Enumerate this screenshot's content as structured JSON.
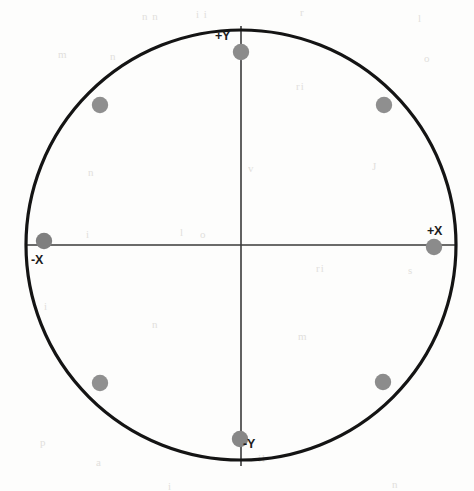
{
  "figure": {
    "background_color": "#fdfdfc",
    "circle": {
      "name": "boundary-circle",
      "center_x": 241,
      "center_y": 245,
      "radius": 215,
      "stroke_color": "#141414",
      "stroke_width": 3.2
    },
    "axes": [
      {
        "name": "horizontal-axis",
        "orientation": "horizontal",
        "x1": 26,
        "y1": 245,
        "x2": 456,
        "y2": 245,
        "stroke_color": "#3a3a3a",
        "stroke_width": 1.6
      },
      {
        "name": "vertical-axis",
        "orientation": "vertical",
        "x1": 241,
        "y1": 26,
        "x2": 241,
        "y2": 466,
        "stroke_color": "#3a3a3a",
        "stroke_width": 1.6
      }
    ],
    "labels": [
      {
        "id": "plus-y",
        "text": "+Y",
        "x": 215,
        "y": 29,
        "anchor": "top-vertical-left"
      },
      {
        "id": "plus-x",
        "text": "+X",
        "x": 427,
        "y": 224,
        "anchor": "right-horizontal-above"
      },
      {
        "id": "minus-x",
        "text": "-X",
        "x": 31,
        "y": 253,
        "anchor": "left-horizontal-below"
      },
      {
        "id": "minus-y",
        "text": "-Y",
        "x": 243,
        "y": 437,
        "anchor": "bottom-vertical-right"
      }
    ],
    "points": [
      {
        "id": "point-top",
        "label": "+Y marker",
        "cx": 241,
        "cy": 52,
        "r": 8.2,
        "color": "#8b8b8b"
      },
      {
        "id": "point-upper-left",
        "label": "upper-left",
        "cx": 100,
        "cy": 105,
        "r": 8.2,
        "color": "#8f8f8f"
      },
      {
        "id": "point-upper-right",
        "label": "upper-right",
        "cx": 384,
        "cy": 105,
        "r": 8.2,
        "color": "#8f8f8f"
      },
      {
        "id": "point-left",
        "label": "-X marker",
        "cx": 44,
        "cy": 241,
        "r": 8.2,
        "color": "#7f7f7f"
      },
      {
        "id": "point-right",
        "label": "+X marker",
        "cx": 434,
        "cy": 247,
        "r": 8.2,
        "color": "#8b8b8b"
      },
      {
        "id": "point-lower-left",
        "label": "lower-left",
        "cx": 100,
        "cy": 383,
        "r": 8.2,
        "color": "#909090"
      },
      {
        "id": "point-lower-right",
        "label": "lower-right",
        "cx": 383,
        "cy": 382,
        "r": 8.2,
        "color": "#8c8c8c"
      },
      {
        "id": "point-bottom",
        "label": "-Y marker",
        "cx": 240,
        "cy": 439,
        "r": 8.2,
        "color": "#878787"
      }
    ],
    "scan_artifacts": [
      {
        "text": "n n",
        "x": 142,
        "y": 10
      },
      {
        "text": "i i",
        "x": 196,
        "y": 8
      },
      {
        "text": "r",
        "x": 300,
        "y": 6
      },
      {
        "text": "l",
        "x": 418,
        "y": 12
      },
      {
        "text": "m",
        "x": 58,
        "y": 48
      },
      {
        "text": "n",
        "x": 110,
        "y": 50
      },
      {
        "text": "ri",
        "x": 296,
        "y": 80
      },
      {
        "text": "o",
        "x": 424,
        "y": 52
      },
      {
        "text": "J",
        "x": 372,
        "y": 160
      },
      {
        "text": "n",
        "x": 88,
        "y": 166
      },
      {
        "text": "v",
        "x": 248,
        "y": 162
      },
      {
        "text": "i",
        "x": 86,
        "y": 228
      },
      {
        "text": "l",
        "x": 180,
        "y": 226
      },
      {
        "text": "o",
        "x": 200,
        "y": 228
      },
      {
        "text": "ri",
        "x": 316,
        "y": 262
      },
      {
        "text": "s",
        "x": 408,
        "y": 264
      },
      {
        "text": "i",
        "x": 44,
        "y": 300
      },
      {
        "text": "n",
        "x": 152,
        "y": 318
      },
      {
        "text": "m",
        "x": 298,
        "y": 330
      },
      {
        "text": "p",
        "x": 40,
        "y": 436
      },
      {
        "text": "a",
        "x": 96,
        "y": 456
      },
      {
        "text": "il",
        "x": 258,
        "y": 452
      },
      {
        "text": "n",
        "x": 392,
        "y": 478
      },
      {
        "text": "i",
        "x": 168,
        "y": 480
      }
    ]
  }
}
